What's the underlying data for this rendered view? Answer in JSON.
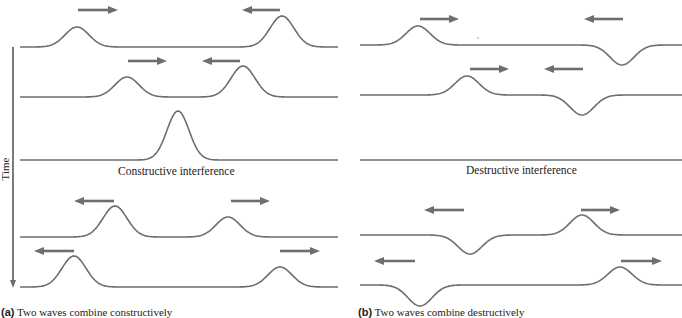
{
  "panel_a": {
    "caption_prefix": "(a)",
    "caption_text": " Two waves combine constructively",
    "interference_label": "Constructive interference",
    "wave_rows": [
      {
        "baseline_y": 47,
        "pulses": [
          {
            "x": 77,
            "amp": -20,
            "dir": "right"
          },
          {
            "x": 282,
            "amp": -31,
            "dir": "left"
          }
        ]
      },
      {
        "baseline_y": 97,
        "pulses": [
          {
            "x": 127,
            "amp": -20,
            "dir": "right"
          },
          {
            "x": 243,
            "amp": -31,
            "dir": "left"
          }
        ]
      },
      {
        "baseline_y": 160,
        "pulses": [
          {
            "x": 178,
            "amp": -49
          }
        ]
      },
      {
        "baseline_y": 237,
        "pulses": [
          {
            "x": 115,
            "amp": -31,
            "dir": "left"
          },
          {
            "x": 228,
            "amp": -20,
            "dir": "right"
          }
        ]
      },
      {
        "baseline_y": 287,
        "pulses": [
          {
            "x": 74,
            "amp": -31,
            "dir": "left"
          },
          {
            "x": 280,
            "amp": -20,
            "dir": "right"
          }
        ]
      }
    ]
  },
  "panel_b": {
    "caption_prefix": "(b)",
    "caption_text": " Two waves combine destructively",
    "interference_label": "Destructive interference",
    "wave_rows": [
      {
        "baseline_y": 45,
        "pulses": [
          {
            "x": 418,
            "amp": -19,
            "dir": "right"
          },
          {
            "x": 622,
            "amp": 20,
            "dir": "left"
          }
        ]
      },
      {
        "baseline_y": 95,
        "pulses": [
          {
            "x": 467,
            "amp": -19,
            "dir": "right"
          },
          {
            "x": 582,
            "amp": 20,
            "dir": "left"
          }
        ]
      },
      {
        "baseline_y": 160,
        "pulses": []
      },
      {
        "baseline_y": 235,
        "pulses": [
          {
            "x": 470,
            "amp": 19,
            "dir": "left"
          },
          {
            "x": 582,
            "amp": -20,
            "dir": "right"
          }
        ]
      },
      {
        "baseline_y": 285,
        "pulses": [
          {
            "x": 420,
            "amp": 21,
            "dir": "left"
          },
          {
            "x": 620,
            "amp": -18,
            "dir": "right"
          }
        ]
      }
    ]
  },
  "axis": {
    "label": "Time",
    "direction": "down"
  },
  "colors": {
    "wave": "#6e6e6e",
    "arrow": "#6e6e6e",
    "text": "#222222"
  }
}
